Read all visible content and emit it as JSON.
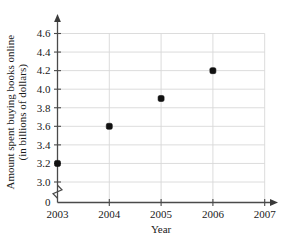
{
  "chart_data": {
    "type": "scatter",
    "title": "",
    "xlabel": "Year",
    "ylabel": "Amount spent buying books online (in billions of dollars)",
    "ylabel_line1": "Amount spent buying books online",
    "ylabel_line2": "(in billions of dollars)",
    "x": [
      2003,
      2004,
      2005,
      2006
    ],
    "values": [
      3.2,
      3.6,
      3.9,
      4.2
    ],
    "points": [
      {
        "x": 2003,
        "y": 3.2
      },
      {
        "x": 2004,
        "y": 3.6
      },
      {
        "x": 2005,
        "y": 3.9
      },
      {
        "x": 2006,
        "y": 4.2
      }
    ],
    "xticks": [
      "2003",
      "2004",
      "2005",
      "2006",
      "2007"
    ],
    "xtick_values": [
      2003,
      2004,
      2005,
      2006,
      2007
    ],
    "yticks": [
      "0",
      "3.0",
      "3.2",
      "3.4",
      "3.6",
      "3.8",
      "4.0",
      "4.2",
      "4.4",
      "4.6"
    ],
    "ytick_values": [
      0,
      3.0,
      3.2,
      3.4,
      3.6,
      3.8,
      4.0,
      4.2,
      4.4,
      4.6
    ],
    "xlim": [
      2003,
      2007
    ],
    "ylim": [
      2.9,
      4.7
    ],
    "axis_break": true,
    "axis_break_between": [
      0,
      3.0
    ],
    "grid": true,
    "grid_color": "#d8d8d8",
    "legend": null,
    "point_color": "#111111",
    "axis_color": "#4a4a4a",
    "background": "#ffffff"
  }
}
